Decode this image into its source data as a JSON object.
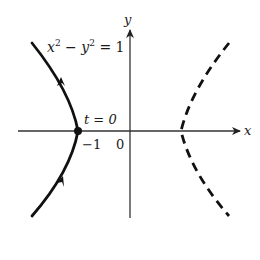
{
  "diagram": {
    "type": "hyperbola-parametric",
    "equation_label": {
      "base1": "x",
      "exp1": "2",
      "minus": " − ",
      "base2": "y",
      "exp2": "2",
      "rhs": " = 1"
    },
    "axis_labels": {
      "x": "x",
      "y": "y"
    },
    "tick_labels": {
      "neg_one": "−1",
      "zero": "0"
    },
    "point_label": "t = 0",
    "branches": [
      {
        "name": "left-branch",
        "style": "solid",
        "direction": "upward (arrows)"
      },
      {
        "name": "right-branch",
        "style": "dashed"
      }
    ],
    "colors": {
      "curve": "#111111",
      "axis": "#333333",
      "text": "#1a1a1a"
    }
  }
}
